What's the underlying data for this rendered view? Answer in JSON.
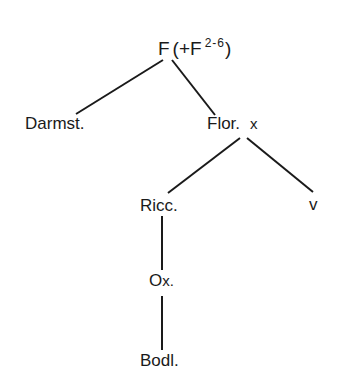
{
  "diagram": {
    "type": "stemma",
    "nodes": [
      {
        "id": "F",
        "label": "F",
        "extra": "(+F",
        "sup": "2-6",
        "close": ")"
      },
      {
        "id": "Darmst",
        "label": "Darmst."
      },
      {
        "id": "Flor",
        "label": "Flor.",
        "suffix": "x"
      },
      {
        "id": "Ricc",
        "label": "Ricc."
      },
      {
        "id": "v",
        "label": "v"
      },
      {
        "id": "Ox",
        "label": "O",
        "suffix": "x."
      },
      {
        "id": "Bodl",
        "label": "Bodl."
      }
    ],
    "edges": [
      {
        "from": "F",
        "to": "Darmst"
      },
      {
        "from": "F",
        "to": "Flor"
      },
      {
        "from": "Flor",
        "to": "Ricc"
      },
      {
        "from": "Flor",
        "to": "v"
      },
      {
        "from": "Ricc",
        "to": "Ox"
      },
      {
        "from": "Ox",
        "to": "Bodl"
      }
    ],
    "line_color": "#1a1a1a"
  }
}
